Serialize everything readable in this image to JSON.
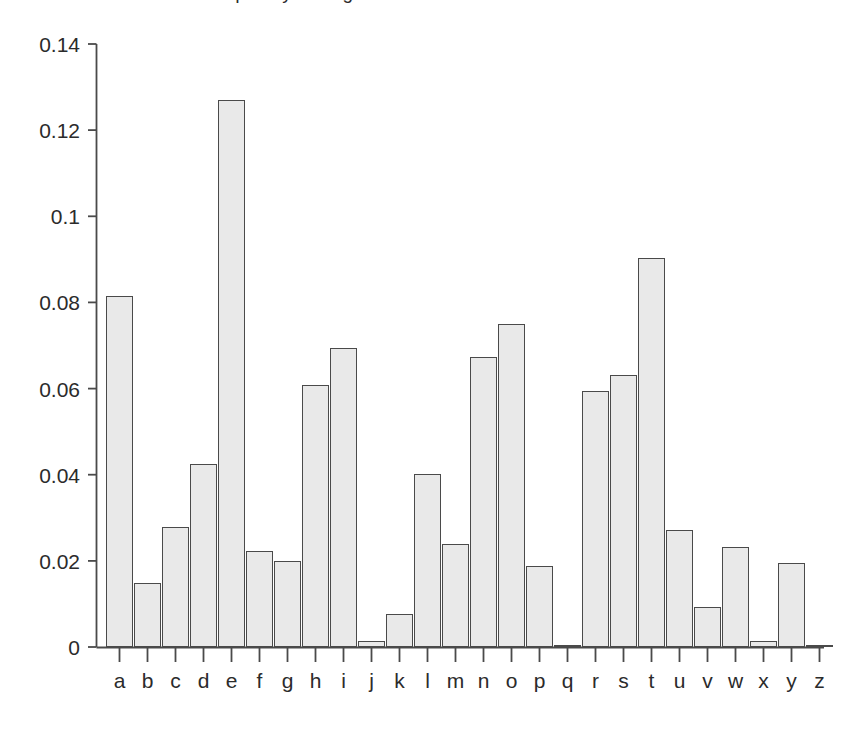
{
  "figure": {
    "title_remnant": "Letter frequency in English",
    "background_color": "#ffffff"
  },
  "axes": {
    "y_tick_labels": [
      "0.14",
      "0.12",
      "0.1",
      "0.08",
      "0.06",
      "0.04",
      "0.02",
      "0"
    ],
    "y_tick_values": [
      0.14,
      0.12,
      0.1,
      0.08,
      0.06,
      0.04,
      0.02,
      0
    ],
    "x_tick_labels": [
      "a",
      "b",
      "c",
      "d",
      "e",
      "f",
      "g",
      "h",
      "i",
      "j",
      "k",
      "l",
      "m",
      "n",
      "o",
      "p",
      "q",
      "r",
      "s",
      "t",
      "u",
      "v",
      "w",
      "x",
      "y",
      "z"
    ],
    "axis_color": "#4a4a4a",
    "tick_label_color": "#2b2b2b"
  },
  "chart_data": {
    "type": "bar",
    "title": "",
    "xlabel": "",
    "ylabel": "",
    "ylim": [
      0,
      0.14
    ],
    "grid": false,
    "legend": null,
    "bar_fill_color": "#e9e9e9",
    "bar_edge_color": "#4a4a4a",
    "categories": [
      "a",
      "b",
      "c",
      "d",
      "e",
      "f",
      "g",
      "h",
      "i",
      "j",
      "k",
      "l",
      "m",
      "n",
      "o",
      "p",
      "q",
      "r",
      "s",
      "t",
      "u",
      "v",
      "w",
      "x",
      "y",
      "z"
    ],
    "values": [
      0.0815,
      0.0149,
      0.0279,
      0.0424,
      0.127,
      0.0223,
      0.02,
      0.0608,
      0.0694,
      0.0013,
      0.0077,
      0.0402,
      0.0239,
      0.0673,
      0.075,
      0.0189,
      0.0005,
      0.0594,
      0.0631,
      0.0902,
      0.0272,
      0.0093,
      0.0233,
      0.0013,
      0.0194,
      0.0004
    ]
  }
}
